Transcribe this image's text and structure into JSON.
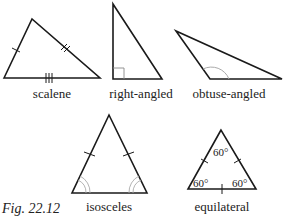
{
  "figure_label": "Fig. 22.12",
  "triangles": [
    {
      "name": "scalene",
      "label": "scalene",
      "marks": "1, 2 and 3 tick marks on sides"
    },
    {
      "name": "right-angled",
      "label": "right-angled",
      "marks": "right angle square"
    },
    {
      "name": "obtuse-angled",
      "label": "obtuse-angled",
      "marks": "obtuse angle arc"
    },
    {
      "name": "isosceles",
      "label": "isosceles",
      "marks": "equal sides ticks, equal base angle double arcs"
    },
    {
      "name": "equilateral",
      "label": "equilateral",
      "marks": "ticks on all sides",
      "angles": [
        "60°",
        "60°",
        "60°"
      ]
    }
  ],
  "colors": {
    "stroke": "#1a1a1a",
    "arc": "#aaaaaa"
  }
}
